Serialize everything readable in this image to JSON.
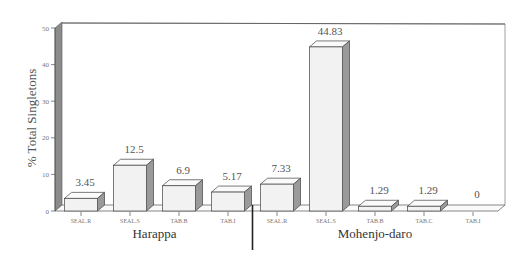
{
  "chart_data": {
    "type": "bar",
    "title": "",
    "xlabel": "",
    "ylabel": "% Total Singletons",
    "ylim": [
      0,
      50
    ],
    "yticks": [
      0,
      10,
      20,
      30,
      40,
      50
    ],
    "grid": false,
    "legend": null,
    "style": "3d-bars",
    "groups": [
      {
        "name": "Harappa",
        "categories": [
          "SEAL.R",
          "SEAL.S",
          "TAB.B",
          "TAB.I"
        ],
        "values": [
          3.45,
          12.5,
          6.9,
          5.17
        ],
        "value_labels": [
          "3.45",
          "12.5",
          "6.9",
          "5.17"
        ]
      },
      {
        "name": "Mohenjo-daro",
        "categories": [
          "SEAL.R",
          "SEAL.S",
          "TAB.B",
          "TAB.C",
          "TAB.I"
        ],
        "values": [
          7.33,
          44.83,
          1.29,
          1.29,
          0
        ],
        "value_labels": [
          "7.33",
          "44.83",
          "1.29",
          "1.29",
          "0"
        ]
      }
    ]
  },
  "colors": {
    "bar_front": "#f2f2f2",
    "bar_top": "#fafafa",
    "bar_side": "#9a9a9a",
    "wall_left": "#8c8c8c",
    "axis": "#555555"
  }
}
